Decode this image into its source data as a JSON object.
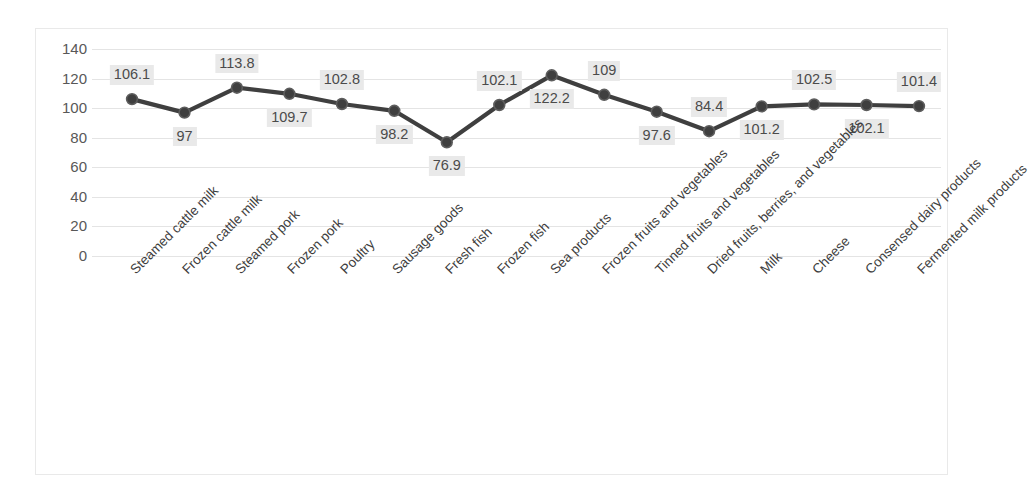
{
  "chart_data": {
    "type": "line",
    "title": "",
    "subtitle": "",
    "xlabel": "",
    "ylabel": "",
    "ylim": [
      0,
      140
    ],
    "yticks": [
      0,
      20,
      40,
      60,
      80,
      100,
      120,
      140
    ],
    "ytick_labels": [
      "0",
      "20",
      "40",
      "60",
      "80",
      "100",
      "120",
      "140"
    ],
    "grid": true,
    "legend": false,
    "legend_position": "none",
    "data_labels": true,
    "marker": "circle",
    "line_color": "#3f3f3f",
    "marker_color": "#3f3f3f",
    "label_bg_color": "#e9e9e9",
    "label_text_color": "#4b4b4b",
    "gridline_color": "#e4e4e4",
    "plot_bg_color": "#ffffff",
    "border_color": "#e9e9e9",
    "categories": [
      "Steamed cattle milk",
      "Frozen cattle milk",
      "Steamed pork",
      "Frozen pork",
      "Poultry",
      "Sausage goods",
      "Fresh fish",
      "Frozen fish",
      "Sea products",
      "Frozen fruits and vegetables",
      "Tinned fruits and vegetables",
      "Dried fruits, berries, and vegetables",
      "Milk",
      "Cheese",
      "Consensed dairy products",
      "Fermented milk products"
    ],
    "values": [
      106.1,
      97,
      113.8,
      109.7,
      102.8,
      98.2,
      76.9,
      102.1,
      122.2,
      109,
      97.6,
      84.4,
      101.2,
      102.5,
      102.1,
      101.4
    ],
    "value_labels": [
      "106.1",
      "97",
      "113.8",
      "109.7",
      "102.8",
      "98.2",
      "76.9",
      "102.1",
      "122.2",
      "109",
      "97.6",
      "84.4",
      "101.2",
      "102.5",
      "102.1",
      "101.4"
    ],
    "label_placement": [
      "above",
      "below",
      "above",
      "below",
      "above",
      "below",
      "below",
      "above",
      "below",
      "above",
      "below",
      "above",
      "below",
      "above",
      "below",
      "above"
    ]
  }
}
